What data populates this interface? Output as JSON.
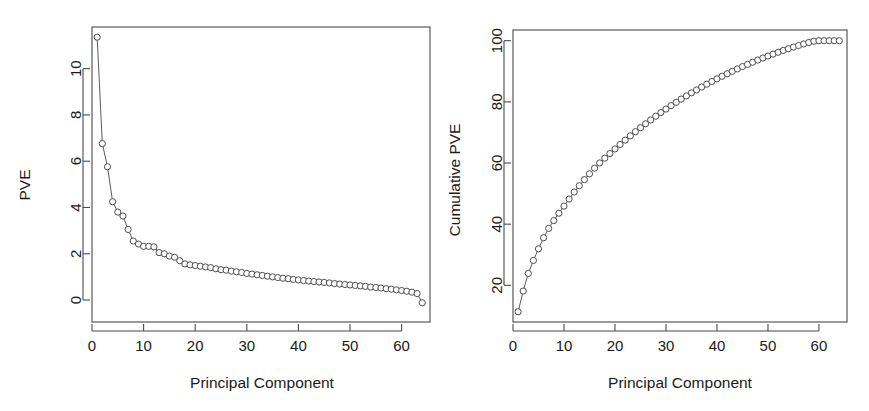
{
  "figure": {
    "background_color": "#ffffff",
    "foreground_color": "#1a1a1a",
    "line_color": "#5b5b5b",
    "marker_stroke_color": "#4d4d4d",
    "marker_fill_color": "#ffffff",
    "axis_color": "#4a4a4a",
    "panel_count": 2
  },
  "panels": [
    {
      "name": "pve-panel",
      "ylabel": "PVE",
      "xlabel": "Principal Component",
      "x_ticks": [
        "0",
        "10",
        "20",
        "30",
        "40",
        "50",
        "60"
      ],
      "y_ticks": [
        "0",
        "2",
        "4",
        "6",
        "8",
        "10"
      ]
    },
    {
      "name": "cumulative-pve-panel",
      "ylabel": "Cumulative PVE",
      "xlabel": "Principal Component",
      "x_ticks": [
        "0",
        "10",
        "20",
        "30",
        "40",
        "50",
        "60"
      ],
      "y_ticks": [
        "20",
        "40",
        "60",
        "80",
        "100"
      ]
    }
  ],
  "chart_data": [
    {
      "type": "line",
      "title": "",
      "subtitle": "",
      "xlabel": "Principal Component",
      "ylabel": "PVE",
      "grid": false,
      "legend": "none",
      "marker": "open-circle",
      "xlim": [
        0.0,
        65.5
      ],
      "ylim": [
        -0.95,
        11.8
      ],
      "xticks": [
        0,
        10,
        20,
        30,
        40,
        50,
        60
      ],
      "yticks": [
        0,
        2,
        4,
        6,
        8,
        10
      ],
      "x": [
        1,
        2,
        3,
        4,
        5,
        6,
        7,
        8,
        9,
        10,
        11,
        12,
        13,
        14,
        15,
        16,
        17,
        18,
        19,
        20,
        21,
        22,
        23,
        24,
        25,
        26,
        27,
        28,
        29,
        30,
        31,
        32,
        33,
        34,
        35,
        36,
        37,
        38,
        39,
        40,
        41,
        42,
        43,
        44,
        45,
        46,
        47,
        48,
        49,
        50,
        51,
        52,
        53,
        54,
        55,
        56,
        57,
        58,
        59,
        60,
        61,
        62,
        63,
        64
      ],
      "values": [
        11.36,
        6.76,
        5.76,
        4.25,
        3.8,
        3.63,
        3.05,
        2.55,
        2.42,
        2.32,
        2.32,
        2.3,
        2.05,
        2.0,
        1.9,
        1.85,
        1.7,
        1.56,
        1.52,
        1.49,
        1.46,
        1.43,
        1.4,
        1.35,
        1.31,
        1.29,
        1.25,
        1.22,
        1.19,
        1.15,
        1.12,
        1.09,
        1.06,
        1.03,
        1.0,
        0.97,
        0.94,
        0.92,
        0.89,
        0.87,
        0.84,
        0.82,
        0.8,
        0.78,
        0.76,
        0.74,
        0.71,
        0.69,
        0.67,
        0.65,
        0.63,
        0.61,
        0.59,
        0.56,
        0.54,
        0.52,
        0.49,
        0.47,
        0.44,
        0.41,
        0.38,
        0.34,
        0.28,
        -0.12
      ]
    },
    {
      "type": "line",
      "title": "",
      "subtitle": "",
      "xlabel": "Principal Component",
      "ylabel": "Cumulative PVE",
      "grid": false,
      "legend": "none",
      "marker": "open-circle",
      "xlim": [
        0.0,
        65.5
      ],
      "ylim": [
        8.0,
        103.5
      ],
      "xticks": [
        0,
        10,
        20,
        30,
        40,
        50,
        60
      ],
      "yticks": [
        20,
        40,
        60,
        80,
        100
      ],
      "x": [
        1,
        2,
        3,
        4,
        5,
        6,
        7,
        8,
        9,
        10,
        11,
        12,
        13,
        14,
        15,
        16,
        17,
        18,
        19,
        20,
        21,
        22,
        23,
        24,
        25,
        26,
        27,
        28,
        29,
        30,
        31,
        32,
        33,
        34,
        35,
        36,
        37,
        38,
        39,
        40,
        41,
        42,
        43,
        44,
        45,
        46,
        47,
        48,
        49,
        50,
        51,
        52,
        53,
        54,
        55,
        56,
        57,
        58,
        59,
        60,
        61,
        62,
        63,
        64
      ],
      "values": [
        11.36,
        18.12,
        23.88,
        28.13,
        31.93,
        35.56,
        38.61,
        41.16,
        43.58,
        45.9,
        48.22,
        50.52,
        52.57,
        54.57,
        56.47,
        58.32,
        60.02,
        61.58,
        63.1,
        64.59,
        66.05,
        67.48,
        68.88,
        70.23,
        71.54,
        72.83,
        74.08,
        75.3,
        76.49,
        77.64,
        78.76,
        79.85,
        80.91,
        81.94,
        82.94,
        83.91,
        84.85,
        85.77,
        86.66,
        87.53,
        88.37,
        89.19,
        89.99,
        90.77,
        91.53,
        92.27,
        92.98,
        93.67,
        94.34,
        94.99,
        95.62,
        96.23,
        96.82,
        97.38,
        97.92,
        98.44,
        98.93,
        99.4,
        99.84,
        100.0,
        100.0,
        100.0,
        100.0,
        100.0
      ]
    }
  ]
}
